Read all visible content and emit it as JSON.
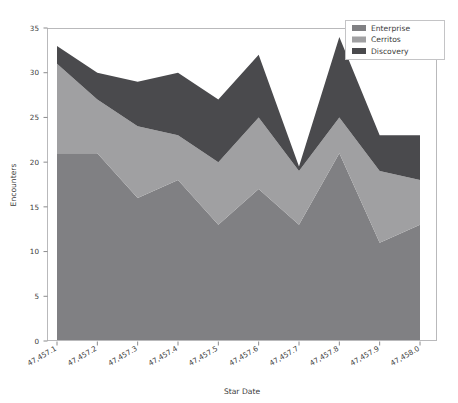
{
  "chart_data": {
    "type": "area",
    "stacked": true,
    "title": "",
    "xlabel": "Star Date",
    "ylabel": "Encounters",
    "x": [
      47457.1,
      47457.2,
      47457.3,
      47457.4,
      47457.5,
      47457.6,
      47457.7,
      47457.8,
      47457.9,
      47458.0
    ],
    "xtick_labels": [
      "47,457.1",
      "47,457.2",
      "47,457.3",
      "47,457.4",
      "47,457.5",
      "47,457.6",
      "47,457.7",
      "47,457.8",
      "47,457.9",
      "47,458.0"
    ],
    "ytick_labels": [
      "0",
      "5",
      "10",
      "15",
      "20",
      "25",
      "30",
      "35"
    ],
    "yticks": [
      0,
      5,
      10,
      15,
      20,
      25,
      30,
      35
    ],
    "ylim": [
      0,
      35
    ],
    "xlim": [
      47457.1,
      47458.0
    ],
    "grid": false,
    "legend_position": "upper right",
    "series": [
      {
        "name": "Enterprise",
        "color": "#808083",
        "values": [
          21,
          21,
          16,
          18,
          13,
          17,
          13,
          21,
          11,
          13
        ]
      },
      {
        "name": "Cerritos",
        "color": "#a0a0a2",
        "values": [
          10,
          6,
          8,
          5,
          7,
          8,
          6,
          4,
          8,
          5
        ]
      },
      {
        "name": "Discovery",
        "color": "#4a4a4d",
        "values": [
          2,
          3,
          5,
          7,
          7,
          7,
          0.5,
          9,
          4,
          5
        ]
      }
    ],
    "totals": [
      33,
      30,
      29,
      30,
      27,
      32,
      19.5,
      34,
      23,
      23
    ]
  },
  "legend": {
    "entries": [
      {
        "label": "Enterprise"
      },
      {
        "label": "Cerritos"
      },
      {
        "label": "Discovery"
      }
    ]
  },
  "axes": {
    "y_title": "Encounters",
    "x_title": "Star Date"
  }
}
